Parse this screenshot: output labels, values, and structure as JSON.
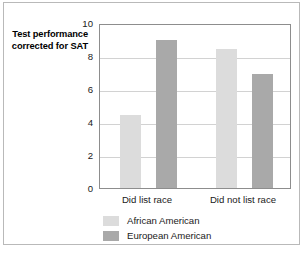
{
  "chart_data": {
    "type": "bar",
    "title": "",
    "xlabel": "",
    "ylabel": "Test performance corrected for SAT",
    "ylim": [
      0,
      10
    ],
    "yticks": [
      "0",
      "2",
      "4",
      "6",
      "8",
      "10"
    ],
    "ytick_values": [
      0,
      2,
      4,
      6,
      8,
      10
    ],
    "grid": true,
    "legend_position": "below-left",
    "categories": [
      "Did list race",
      "Did not list race"
    ],
    "series": [
      {
        "name": "African American",
        "color": "#dcdcdc",
        "values": [
          4.4,
          8.4
        ]
      },
      {
        "name": "European American",
        "color": "#a9a9a9",
        "values": [
          9.0,
          6.9
        ]
      }
    ]
  },
  "axis": {
    "y_title": "Test performance corrected for SAT"
  },
  "colors": {
    "frame_border": "#b9b9b9",
    "axis_line": "#8d8d8d",
    "gridline": "#d2d2d2",
    "african_american": "#dcdcdc",
    "european_american": "#a9a9a9"
  }
}
